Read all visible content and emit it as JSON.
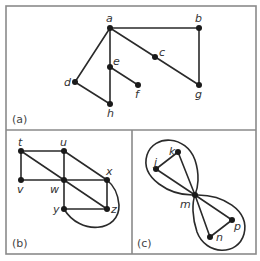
{
  "figure": {
    "panels": [
      {
        "id": "a",
        "caption": "(a)",
        "nodes": [
          {
            "label": "a",
            "x": 110,
            "y": 28
          },
          {
            "label": "b",
            "x": 199,
            "y": 28
          },
          {
            "label": "c",
            "x": 155,
            "y": 57
          },
          {
            "label": "d",
            "x": 75,
            "y": 82
          },
          {
            "label": "e",
            "x": 110,
            "y": 67
          },
          {
            "label": "f",
            "x": 138,
            "y": 85
          },
          {
            "label": "g",
            "x": 199,
            "y": 85
          },
          {
            "label": "h",
            "x": 110,
            "y": 104
          }
        ],
        "edges": [
          [
            "a",
            "b"
          ],
          [
            "a",
            "d"
          ],
          [
            "a",
            "e"
          ],
          [
            "a",
            "c"
          ],
          [
            "c",
            "g"
          ],
          [
            "b",
            "g"
          ],
          [
            "d",
            "h"
          ],
          [
            "e",
            "h"
          ],
          [
            "e",
            "f"
          ]
        ]
      },
      {
        "id": "b",
        "caption": "(b)",
        "nodes": [
          {
            "label": "t",
            "x": 21,
            "y": 151
          },
          {
            "label": "u",
            "x": 64,
            "y": 151
          },
          {
            "label": "v",
            "x": 21,
            "y": 180
          },
          {
            "label": "w",
            "x": 64,
            "y": 180
          },
          {
            "label": "x",
            "x": 107,
            "y": 180
          },
          {
            "label": "y",
            "x": 64,
            "y": 209
          },
          {
            "label": "z",
            "x": 107,
            "y": 209
          }
        ],
        "edges": [
          [
            "t",
            "u"
          ],
          [
            "t",
            "v"
          ],
          [
            "t",
            "w"
          ],
          [
            "w",
            "z"
          ],
          [
            "u",
            "w"
          ],
          [
            "u",
            "x"
          ],
          [
            "v",
            "w"
          ],
          [
            "w",
            "x"
          ],
          [
            "w",
            "y"
          ],
          [
            "x",
            "z"
          ],
          [
            "y",
            "z"
          ]
        ],
        "curved_edges": [
          [
            "y",
            "x"
          ]
        ]
      },
      {
        "id": "c",
        "caption": "(c)",
        "nodes": [
          {
            "label": "j",
            "x": 156,
            "y": 169
          },
          {
            "label": "k",
            "x": 178,
            "y": 152
          },
          {
            "label": "m",
            "x": 195,
            "y": 195
          },
          {
            "label": "n",
            "x": 210,
            "y": 237
          },
          {
            "label": "p",
            "x": 232,
            "y": 220
          }
        ],
        "edges": [
          [
            "j",
            "k"
          ],
          [
            "j",
            "m"
          ],
          [
            "k",
            "m"
          ],
          [
            "m",
            "n"
          ],
          [
            "m",
            "p"
          ],
          [
            "n",
            "p"
          ]
        ],
        "loops": [
          [
            "m",
            "j-k side"
          ],
          [
            "m",
            "n-p side"
          ]
        ]
      }
    ]
  }
}
